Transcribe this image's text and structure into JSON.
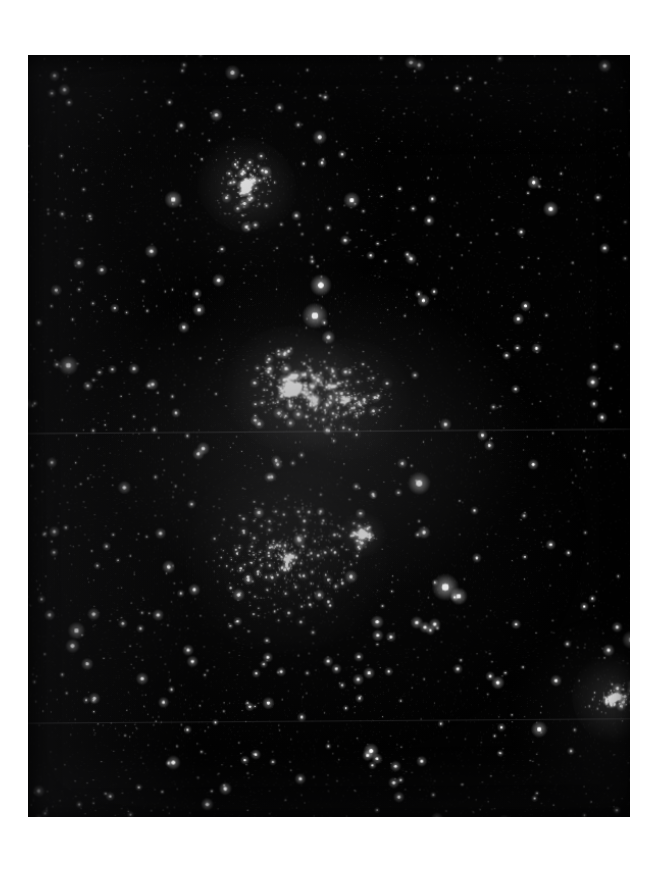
{
  "image": {
    "kind": "astronomical-photographic-plate",
    "subject": "dense Milky Way star field with open clusters",
    "canvas_width": 654,
    "canvas_height": 872,
    "page_background": "#ffffff",
    "plate": {
      "x": 28,
      "y": 55,
      "width": 602,
      "height": 762,
      "rotation_deg": -0.42,
      "background_color": "#030303",
      "border_color": "#000000",
      "corner_top_left": [
        29,
        58
      ],
      "corner_top_right": [
        628,
        55
      ],
      "corner_bottom_left": [
        31,
        816
      ],
      "corner_bottom_right": [
        630,
        812
      ]
    },
    "artifacts": {
      "scan_seams": [
        {
          "name": "upper-seam",
          "y_plate": 376,
          "opacity": 0.3
        },
        {
          "name": "lower-seam",
          "y_plate": 660,
          "opacity": 0.24
        }
      ],
      "grain_opacity": 0.06,
      "vignette": "inset dark edge"
    }
  },
  "chart_data": {
    "type": "scatter",
    "title": "",
    "xlabel": "",
    "ylabel": "",
    "xlim": [
      0,
      602
    ],
    "ylim": [
      0,
      762
    ],
    "grid": false,
    "legend": "none",
    "note": "Star positions in plate-local pixel coordinates. r = apparent radius, b = brightness 0-1.",
    "clusters": [
      {
        "name": "upper-cluster",
        "label": "bright compact cluster, upper centre",
        "cx": 222,
        "cy": 135,
        "rx": 26,
        "ry": 34,
        "count": 190,
        "core_brightness": 1.0,
        "concentration": 2.4,
        "tilt_deg": 35
      },
      {
        "name": "central-cluster",
        "label": "large bright cluster, centre of plate",
        "cx": 266,
        "cy": 335,
        "rx": 46,
        "ry": 40,
        "count": 420,
        "core_brightness": 1.0,
        "concentration": 1.9,
        "tilt_deg": 10
      },
      {
        "name": "central-cluster-halo",
        "label": "diffuse halo east of central cluster",
        "cx": 318,
        "cy": 345,
        "rx": 44,
        "ry": 36,
        "count": 240,
        "core_brightness": 0.62,
        "concentration": 1.2,
        "tilt_deg": 0
      },
      {
        "name": "small-cluster",
        "label": "small compact cluster, lower centre-right",
        "cx": 333,
        "cy": 478,
        "rx": 16,
        "ry": 15,
        "count": 95,
        "core_brightness": 0.95,
        "concentration": 2.6,
        "tilt_deg": 0
      },
      {
        "name": "rich-field-cluster",
        "label": "rich loose aggregation, lower centre",
        "cx": 258,
        "cy": 500,
        "rx": 70,
        "ry": 62,
        "count": 430,
        "core_brightness": 0.45,
        "concentration": 1.0,
        "tilt_deg": 0
      },
      {
        "name": "edge-cluster",
        "label": "bright cluster at right edge, lower right",
        "cx": 578,
        "cy": 640,
        "rx": 16,
        "ry": 30,
        "count": 150,
        "core_brightness": 1.0,
        "concentration": 2.2,
        "tilt_deg": 75
      }
    ],
    "field": {
      "label": "scattered foreground / background field stars",
      "count": 2600,
      "density_gradient": "richer toward lower-left and centre"
    },
    "bright_stars": [
      {
        "x": 294,
        "y": 233,
        "r": 4.2,
        "b": 1.0,
        "label": "bright-star-a"
      },
      {
        "x": 288,
        "y": 263,
        "r": 5.0,
        "b": 1.0,
        "label": "bright-star-b"
      },
      {
        "x": 389,
        "y": 428,
        "r": 4.4,
        "b": 1.0,
        "label": "bright-star-c"
      },
      {
        "x": 414,
        "y": 530,
        "r": 5.2,
        "b": 1.0,
        "label": "bright-star-d"
      },
      {
        "x": 427,
        "y": 539,
        "r": 3.4,
        "b": 0.95,
        "label": "bright-star-e"
      },
      {
        "x": 46,
        "y": 310,
        "r": 3.8,
        "b": 0.95,
        "label": "bright-star-f"
      },
      {
        "x": 209,
        "y": 24,
        "r": 3.0,
        "b": 0.9,
        "label": "bright-star-g"
      },
      {
        "x": 150,
        "y": 148,
        "r": 3.4,
        "b": 0.95,
        "label": "bright-star-h"
      },
      {
        "x": 325,
        "y": 150,
        "r": 3.2,
        "b": 0.9,
        "label": "bright-star-i"
      },
      {
        "x": 596,
        "y": 583,
        "r": 3.6,
        "b": 0.95,
        "label": "bright-star-j"
      },
      {
        "x": 52,
        "y": 570,
        "r": 3.4,
        "b": 0.9,
        "label": "bright-star-k"
      },
      {
        "x": 48,
        "y": 585,
        "r": 2.8,
        "b": 0.85,
        "label": "bright-star-l"
      },
      {
        "x": 520,
        "y": 160,
        "r": 3.0,
        "b": 0.9,
        "label": "bright-star-m"
      },
      {
        "x": 294,
        "y": 88,
        "r": 2.8,
        "b": 0.85,
        "label": "bright-star-n"
      },
      {
        "x": 505,
        "y": 670,
        "r": 3.2,
        "b": 0.9,
        "label": "bright-star-o"
      },
      {
        "x": 340,
        "y": 690,
        "r": 3.0,
        "b": 0.88,
        "label": "bright-star-p"
      },
      {
        "x": 146,
        "y": 700,
        "r": 2.8,
        "b": 0.85,
        "label": "bright-star-q"
      },
      {
        "x": 560,
        "y": 330,
        "r": 2.6,
        "b": 0.82,
        "label": "bright-star-r"
      },
      {
        "x": 574,
        "y": 20,
        "r": 2.6,
        "b": 0.82,
        "label": "bright-star-s"
      },
      {
        "x": 392,
        "y": 18,
        "r": 2.4,
        "b": 0.8,
        "label": "bright-star-t"
      },
      {
        "x": 100,
        "y": 430,
        "r": 2.6,
        "b": 0.82,
        "label": "bright-star-u"
      },
      {
        "x": 470,
        "y": 760,
        "r": 2.6,
        "b": 0.8,
        "label": "bright-star-v"
      }
    ]
  }
}
